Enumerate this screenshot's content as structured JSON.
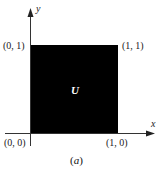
{
  "figure": {
    "caption_open": "(",
    "caption_letter": "a",
    "caption_close": ")",
    "region_label": "U",
    "axes": {
      "x_label": "x",
      "y_label": "y"
    },
    "points": {
      "origin": "(0, 0)",
      "x_one": "(1, 0)",
      "y_one": "(0, 1)",
      "corner": "(1, 1)"
    },
    "colors": {
      "fill": "#000000",
      "axis": "#333333",
      "background": "#ffffff"
    }
  }
}
